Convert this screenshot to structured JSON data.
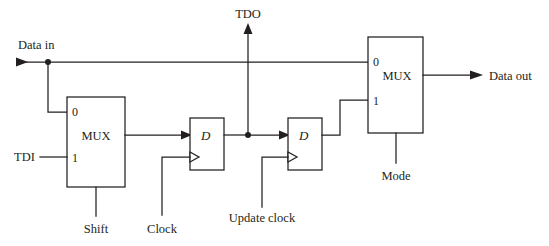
{
  "diagram": {
    "title_visible": false,
    "type": "digital-logic-schematic",
    "colors": {
      "line": "#231f20",
      "background": "#ffffff",
      "fill": "#ffffff"
    },
    "signals": {
      "data_in": "Data in",
      "data_out": "Data out",
      "tdi": "TDI",
      "tdo": "TDO",
      "shift": "Shift",
      "clock": "Clock",
      "update_clock": "Update clock",
      "mode": "Mode"
    },
    "blocks": {
      "mux_left": {
        "name": "MUX",
        "port_0": "0",
        "port_1": "1",
        "select_label": "Shift"
      },
      "mux_right": {
        "name": "MUX",
        "port_0": "0",
        "port_1": "1",
        "select_label": "Mode"
      },
      "ff_capture": {
        "name": "D",
        "clock_label": "Clock"
      },
      "ff_update": {
        "name": "D",
        "clock_label": "Update clock"
      }
    }
  }
}
